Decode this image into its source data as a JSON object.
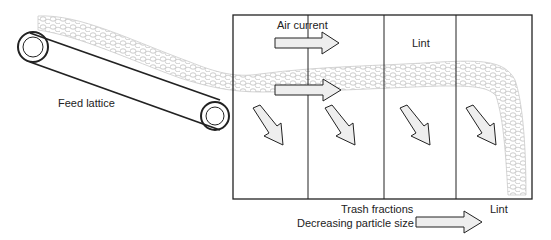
{
  "diagram": {
    "labels": {
      "feed_lattice": "Feed lattice",
      "air_current": "Air current",
      "lint_top": "Lint",
      "trash_fractions": "Trash fractions",
      "decreasing_particle_size": "Decreasing particle size",
      "lint_bottom": "Lint"
    },
    "colors": {
      "stroke": "#222222",
      "fiber": "#bdbdbd",
      "arrow_fill": "#eeeeee"
    },
    "chamber": {
      "compartments": 4
    }
  }
}
